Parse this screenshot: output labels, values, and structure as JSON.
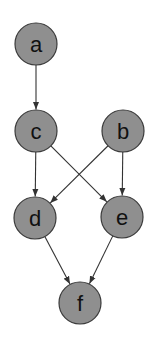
{
  "diagram": {
    "type": "directed-graph",
    "node_fill": "#8f8f8f",
    "node_stroke": "#3a3a3a",
    "edge_color": "#333333",
    "node_radius": 21,
    "nodes": [
      {
        "id": "a",
        "label": "a",
        "x": 36,
        "y": 44
      },
      {
        "id": "c",
        "label": "c",
        "x": 36,
        "y": 131
      },
      {
        "id": "b",
        "label": "b",
        "x": 123,
        "y": 131
      },
      {
        "id": "d",
        "label": "d",
        "x": 35,
        "y": 218
      },
      {
        "id": "e",
        "label": "e",
        "x": 122,
        "y": 217
      },
      {
        "id": "f",
        "label": "f",
        "x": 80,
        "y": 303
      }
    ],
    "edges": [
      {
        "from": "a",
        "to": "c"
      },
      {
        "from": "c",
        "to": "d"
      },
      {
        "from": "c",
        "to": "e"
      },
      {
        "from": "b",
        "to": "d"
      },
      {
        "from": "b",
        "to": "e"
      },
      {
        "from": "d",
        "to": "f"
      },
      {
        "from": "e",
        "to": "f"
      }
    ]
  }
}
